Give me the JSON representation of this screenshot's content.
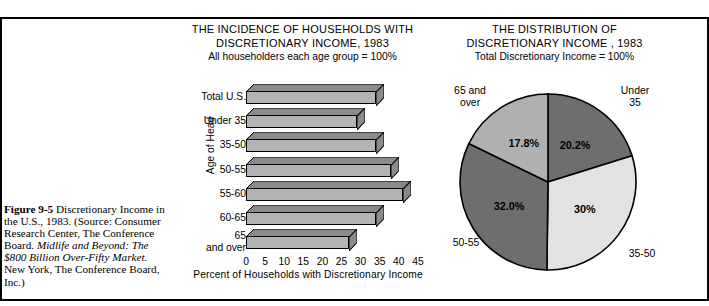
{
  "caption": {
    "figure_number": "Figure 9-5",
    "line1": "Discretionary",
    "line2": "Income in the U.S., 1983.",
    "line3": "(Source: Consumer Research",
    "line4": "Center, The Conference",
    "line5_plain": "Board. ",
    "line5_italic": "Midlife and Beyond:",
    "line6_italic": "The $800 Billion Over-Fifty",
    "line7_italic": "Market.",
    "line7_plain": " New York, The",
    "line8": "Conference Board, Inc.)"
  },
  "bar_chart": {
    "title_line1": "THE INCIDENCE OF HOUSEHOLDS WITH",
    "title_line2": "DISCRETIONARY INCOME, 1983",
    "subtitle": "All householders each age group = 100%",
    "ylabel": "Age of Head",
    "xlabel": "Percent of Households with Discretionary Income"
  },
  "pie_chart": {
    "title_line1": "THE DISTRIBUTION OF",
    "title_line2": "DISCRETIONARY INCOME , 1983",
    "subtitle": "Total Discretionary Income = 100%"
  },
  "colors": {
    "bar_front": "#b3b3b3",
    "bar_top": "#8a8a8a",
    "bar_side": "#8a8a8a",
    "pie_dark": "#6e6e6e",
    "pie_mid": "#b0b0b0",
    "pie_light": "#e2e2e2",
    "outline": "#000000",
    "background": "#ffffff"
  },
  "chart_data": [
    {
      "type": "bar",
      "orientation": "horizontal",
      "title": "THE INCIDENCE OF HOUSEHOLDS WITH DISCRETIONARY INCOME, 1983",
      "subtitle": "All householders each age group = 100%",
      "xlabel": "Percent of Households with Discretionary Income",
      "ylabel": "Age of Head",
      "categories": [
        "Total U.S.",
        "Under 35",
        "35-50",
        "50-55",
        "55-60",
        "60-65",
        "65\nand over"
      ],
      "values": [
        34,
        29,
        34,
        38,
        41,
        34,
        27
      ],
      "xlim": [
        0,
        45
      ],
      "xticks": [
        0,
        5,
        10,
        15,
        20,
        25,
        30,
        35,
        40,
        45
      ],
      "xtick_labels": [
        "0",
        "5",
        "10",
        "15",
        "20",
        "25",
        "30",
        "35",
        "40",
        "45"
      ],
      "grid": false,
      "legend": "none",
      "style": "3d-shaded-bars"
    },
    {
      "type": "pie",
      "title": "THE DISTRIBUTION OF DISCRETIONARY INCOME , 1983",
      "subtitle": "Total Discretionary Income = 100%",
      "labels": [
        "Under 35",
        "35-50",
        "50-55",
        "65 and over"
      ],
      "values": [
        20.2,
        30.0,
        32.0,
        17.8
      ],
      "value_labels": [
        "20.2%",
        "30%",
        "32.0%",
        "17.8%"
      ],
      "slice_colors": [
        "#6e6e6e",
        "#e2e2e2",
        "#6e6e6e",
        "#b0b0b0"
      ],
      "start_angle_deg": 0,
      "direction": "clockwise",
      "legend": "outside-labels"
    }
  ]
}
